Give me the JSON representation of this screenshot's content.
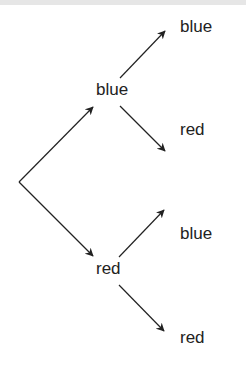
{
  "diagram": {
    "type": "probability-tree",
    "root": {
      "x": 19,
      "y": 182
    },
    "stroke_color": "#222222",
    "text_color": "#222222",
    "level1": [
      {
        "label": "blue",
        "children": [
          {
            "label": "blue"
          },
          {
            "label": "red"
          }
        ]
      },
      {
        "label": "red",
        "children": [
          {
            "label": "blue"
          },
          {
            "label": "red"
          }
        ]
      }
    ]
  }
}
